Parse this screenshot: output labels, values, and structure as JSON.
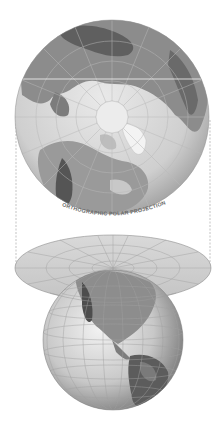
{
  "diagram": {
    "caption": "ORTHOGRAPHIC POLAR PROJECTION",
    "top_globe": {
      "view": "north-pole-centered",
      "label": "orthographic polar globe"
    },
    "projection_plane": {
      "label": "flat polar projection disk"
    },
    "bottom_globe": {
      "view": "americas-facing",
      "label": "earth globe"
    },
    "colors": {
      "ocean": "#d4d4d4",
      "land": "#8a8a8a",
      "land_dark": "#5a5a5a",
      "grid": "#a8a8a8",
      "plane": "#d0d0d0",
      "dashes": "#999999"
    }
  }
}
